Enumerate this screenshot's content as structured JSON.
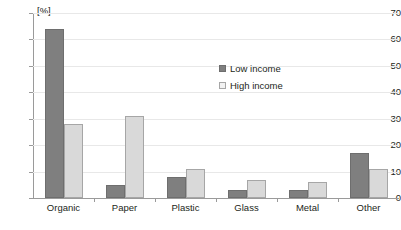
{
  "chart_data": {
    "type": "bar",
    "title": "",
    "xlabel": "",
    "ylabel": "[%]",
    "unit_label": "[%]",
    "ylim": [
      0,
      70
    ],
    "ytick_step": 10,
    "yticks": [
      70,
      60,
      50,
      40,
      30,
      20,
      10,
      0
    ],
    "ytick_labels": [
      "70",
      "60",
      "50",
      "40",
      "30",
      "20",
      "10",
      "0"
    ],
    "grid": true,
    "grid_axis": "y",
    "legend_position": "inside-upper-center",
    "categories": [
      "Organic",
      "Paper",
      "Plastic",
      "Glass",
      "Metal",
      "Other"
    ],
    "series": [
      {
        "name": "Low income",
        "color": "#7f7f7f",
        "values": [
          64,
          5,
          8,
          3,
          3,
          17
        ]
      },
      {
        "name": "High income",
        "color": "#d9d9d9",
        "values": [
          28,
          31,
          11,
          7,
          6,
          11
        ]
      }
    ]
  },
  "legend": {
    "items": [
      {
        "label": "Low income",
        "swatch": "low"
      },
      {
        "label": "High income",
        "swatch": "high"
      }
    ]
  }
}
